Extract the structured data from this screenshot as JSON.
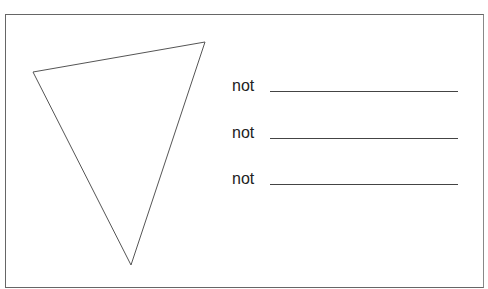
{
  "diagram": {
    "shape": "inverted-triangle",
    "items": [
      {
        "label": "not",
        "answer": ""
      },
      {
        "label": "not",
        "answer": ""
      },
      {
        "label": "not",
        "answer": ""
      }
    ]
  }
}
